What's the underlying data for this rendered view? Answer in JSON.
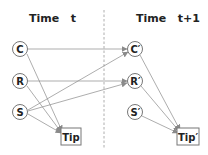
{
  "diagram": {
    "type": "dynamic-bayesian-network",
    "titles": {
      "left": "Time   t",
      "right": "Time   t+1"
    },
    "nodes": [
      {
        "id": "C",
        "label": "C",
        "shape": "circle",
        "x": 20,
        "y": 49,
        "slice": "t"
      },
      {
        "id": "R",
        "label": "R",
        "shape": "circle",
        "x": 20,
        "y": 81,
        "slice": "t"
      },
      {
        "id": "S",
        "label": "S",
        "shape": "circle",
        "x": 20,
        "y": 112,
        "slice": "t"
      },
      {
        "id": "Tip",
        "label": "Tip",
        "shape": "box",
        "x": 71,
        "y": 137,
        "slice": "t"
      },
      {
        "id": "C1",
        "label": "C′",
        "shape": "circle",
        "x": 135,
        "y": 49,
        "slice": "t+1"
      },
      {
        "id": "R1",
        "label": "R′",
        "shape": "circle",
        "x": 135,
        "y": 81,
        "slice": "t+1"
      },
      {
        "id": "S1",
        "label": "S′",
        "shape": "circle",
        "x": 135,
        "y": 112,
        "slice": "t+1"
      },
      {
        "id": "Tip1",
        "label": "Tip′",
        "shape": "box",
        "x": 188,
        "y": 137,
        "slice": "t+1"
      }
    ],
    "edges": [
      {
        "from": "C",
        "to": "Tip"
      },
      {
        "from": "R",
        "to": "Tip"
      },
      {
        "from": "S",
        "to": "Tip"
      },
      {
        "from": "C",
        "to": "C1"
      },
      {
        "from": "R",
        "to": "R1"
      },
      {
        "from": "S",
        "to": "C1"
      },
      {
        "from": "S",
        "to": "R1"
      },
      {
        "from": "C1",
        "to": "Tip1"
      },
      {
        "from": "R1",
        "to": "Tip1"
      },
      {
        "from": "S1",
        "to": "Tip1"
      }
    ]
  }
}
